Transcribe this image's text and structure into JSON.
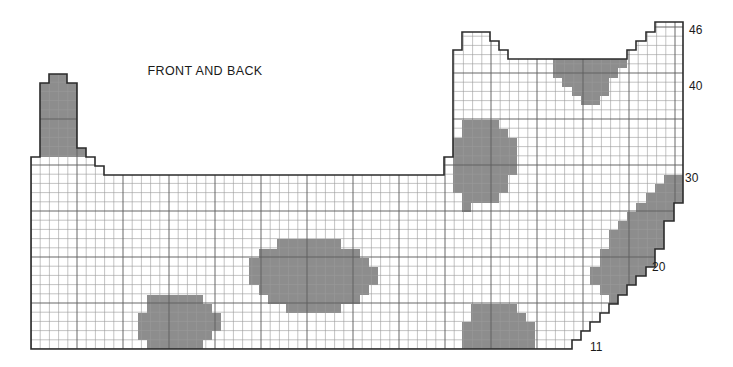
{
  "chart_title": "FRONT AND BACK",
  "title_position": {
    "x": 205,
    "y": 72
  },
  "colors": {
    "background": "#ffffff",
    "grid_line": "#9a9a9a",
    "grid_line_major": "#5f5f5f",
    "outline": "#2b2b2b",
    "motif_fill": "#8d8d8d",
    "label_text": "#1a1a1a"
  },
  "grid": {
    "cell_width": 9.2,
    "cell_height": 9.2,
    "origin_x": 31,
    "origin_y": 349,
    "columns": 71,
    "rows": 36,
    "major_every": 5,
    "grid_visible": true
  },
  "row_labels": [
    {
      "text": "46",
      "row": 35,
      "x": 689,
      "y": 31
    },
    {
      "text": "40",
      "row": 29,
      "x": 689,
      "y": 87
    },
    {
      "text": "30",
      "row": 20,
      "x": 685,
      "y": 179
    },
    {
      "text": "20",
      "row": 10,
      "x": 652,
      "y": 268
    },
    {
      "text": "11",
      "row": 1,
      "x": 590,
      "y": 348
    }
  ],
  "outline_path": "M 31 349 L 31 157 L 40 157 L 40 83 L 49 83 L 49 74 L 67 74 L 67 83 L 77 83 L 77 148 L 86 148 L 86 157 L 95 157 L 95 166 L 104 166 L 104 175 L 444 175 L 444 157 L 453 157 L 453 50 L 462 50 L 462 32 L 490 32 L 490 41 L 499 41 L 499 50 L 508 50 L 508 59 L 627 59 L 627 50 L 636 50 L 636 41 L 646 41 L 646 32 L 655 32 L 655 22 L 683 22 L 683 203 L 674 203 L 674 221 L 664 221 L 664 249 L 655 249 L 655 267 L 646 267 L 646 276 L 636 276 L 636 285 L 627 285 L 627 295 L 618 295 L 618 304 L 609 304 L 609 313 L 600 313 L 600 322 L 590 322 L 590 331 L 581 331 L 581 340 L 572 340 L 572 349 Z",
  "motifs": [
    {
      "name": "motif-left-tower",
      "description": "Dark block at upper-left edge of chart",
      "path": "M 40 157 L 40 83 L 49 83 L 49 74 L 67 74 L 67 83 L 77 83 L 77 148 L 86 148 L 86 157 Z"
    },
    {
      "name": "motif-top-right",
      "description": "Oval motif near top right under the neckline",
      "path": "M 553 59 L 627 59 L 627 68 L 618 68 L 618 78 L 609 78 L 609 96 L 600 96 L 600 105 L 581 105 L 581 96 L 572 96 L 572 87 L 562 87 L 562 78 L 553 78 Z"
    },
    {
      "name": "motif-upper-center",
      "description": "Round motif in upper middle area",
      "path": "M 462 120 L 499 120 L 499 129 L 508 129 L 508 138 L 517 138 L 517 175 L 508 175 L 508 193 L 499 193 L 499 203 L 471 203 L 471 212 L 462 212 L 462 193 L 453 193 L 453 138 L 462 138 Z"
    },
    {
      "name": "motif-center",
      "description": "Large central oval motif",
      "path": "M 277 239 L 341 239 L 341 249 L 360 249 L 360 258 L 369 258 L 369 267 L 378 267 L 378 285 L 369 285 L 369 295 L 360 295 L 360 304 L 341 304 L 341 313 L 286 313 L 286 304 L 268 304 L 268 295 L 259 295 L 259 285 L 249 285 L 249 258 L 259 258 L 259 249 L 277 249 Z"
    },
    {
      "name": "motif-lower-left",
      "description": "Rounded motif at lower left",
      "path": "M 147 295 L 203 295 L 203 304 L 212 304 L 212 313 L 221 313 L 221 331 L 212 331 L 212 340 L 203 340 L 203 349 L 147 349 L 147 340 L 138 340 L 138 313 L 147 313 Z"
    },
    {
      "name": "motif-lower-center",
      "description": "Rounded motif at lower center",
      "path": "M 471 304 L 517 304 L 517 313 L 526 313 L 526 322 L 535 322 L 535 349 L 462 349 L 462 322 L 471 322 Z"
    },
    {
      "name": "motif-right-diagonal",
      "description": "Large diagonal band motif hugging the lower right edge",
      "path": "M 683 203 L 674 203 L 674 221 L 664 221 L 664 249 L 655 249 L 655 267 L 646 267 L 646 276 L 636 276 L 636 285 L 627 285 L 627 295 L 618 295 L 618 304 L 609 304 L 609 295 L 600 295 L 600 285 L 590 285 L 590 267 L 600 267 L 600 249 L 609 249 L 609 230 L 618 230 L 618 221 L 627 221 L 627 212 L 636 212 L 636 203 L 646 203 L 646 193 L 655 193 L 655 184 L 664 184 L 664 175 L 683 175 Z"
    }
  ],
  "chart_data": {
    "type": "heatmap",
    "title": "FRONT AND BACK",
    "xlabel": "",
    "ylabel": "",
    "legend": [],
    "annotations": [
      "46",
      "40",
      "30",
      "20",
      "11"
    ],
    "grid": true,
    "row_tick_values": [
      11,
      20,
      30,
      40,
      46
    ],
    "columns": 71,
    "rows": 36,
    "cell_states": [
      "empty",
      "filled"
    ],
    "motif_count": 7
  }
}
